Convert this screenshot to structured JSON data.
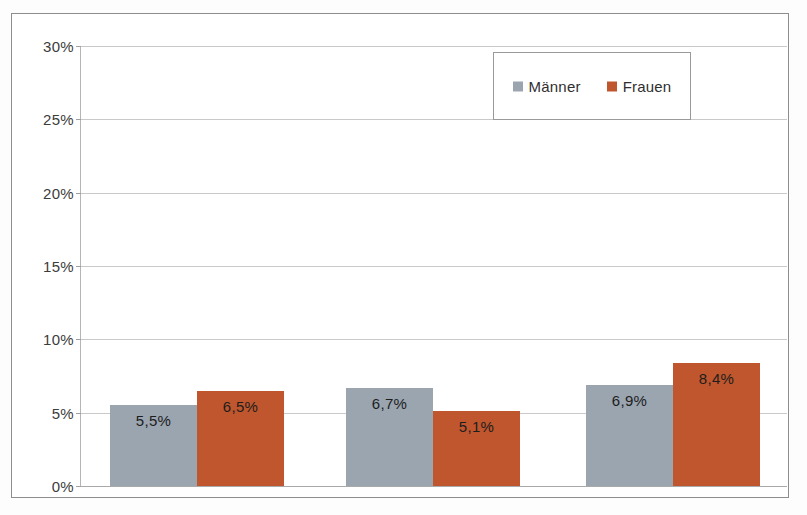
{
  "chart_data": {
    "type": "bar",
    "title": "",
    "xlabel": "",
    "ylabel": "",
    "categories": [
      "20 bis 29",
      "30 bis 39",
      "40 bis 50"
    ],
    "series": [
      {
        "name": "Männer",
        "color": "#9aa5b0",
        "values": [
          5.5,
          6.7,
          6.9
        ],
        "labels": [
          "5,5%",
          "6,7%",
          "6,9%"
        ]
      },
      {
        "name": "Frauen",
        "color": "#c0562e",
        "values": [
          6.5,
          5.1,
          8.4
        ],
        "labels": [
          "6,5%",
          "5,1%",
          "8,4%"
        ]
      }
    ],
    "ylim": [
      0,
      30
    ],
    "ytick_values": [
      0,
      5,
      10,
      15,
      20,
      25,
      30
    ],
    "ytick_labels": [
      "0%",
      "5%",
      "10%",
      "15%",
      "20%",
      "25%",
      "30%"
    ],
    "grid": true,
    "legend_position": "top-center",
    "legend_entries": [
      "Männer",
      "Frauen"
    ]
  },
  "legend": {
    "entries": [
      {
        "label": "Männer",
        "swatch": "maenner-swatch-icon"
      },
      {
        "label": "Frauen",
        "swatch": "frauen-swatch-icon"
      }
    ]
  }
}
